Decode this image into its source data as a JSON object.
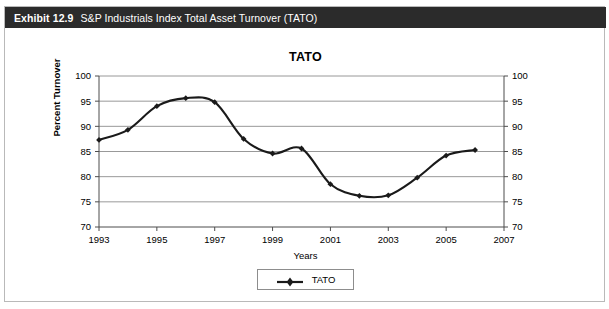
{
  "exhibit": {
    "number": "Exhibit 12.9",
    "caption": "S&P Industrials Index Total Asset Turnover (TATO)"
  },
  "legend": {
    "series_label": "TATO"
  },
  "colors": {
    "header_background": "#2b2b2b",
    "header_text": "#ffffff",
    "series_line": "#1a1a1a",
    "gridline": "#8d8d8d",
    "axis": "#4d4d4d",
    "card_border": "#b9b9b9"
  },
  "chart_data": {
    "type": "line",
    "title": "TATO",
    "xlabel": "Years",
    "ylabel": "Percent Turnover",
    "x": [
      1993,
      1994,
      1995,
      1996,
      1997,
      1998,
      1999,
      2000,
      2001,
      2002,
      2003,
      2004,
      2005,
      2006
    ],
    "series": [
      {
        "name": "TATO",
        "values": [
          87.3,
          89.3,
          94.0,
          95.6,
          94.8,
          87.5,
          84.6,
          85.6,
          78.5,
          76.2,
          76.3,
          79.8,
          84.2,
          85.3
        ]
      }
    ],
    "xlim": [
      1993,
      2007
    ],
    "ylim": [
      70,
      100
    ],
    "xticks": [
      1993,
      1995,
      1997,
      1999,
      2001,
      2003,
      2005,
      2007
    ],
    "xticklabels": [
      "1993",
      "1995",
      "1997",
      "1999",
      "2001",
      "2003",
      "2005",
      "2007"
    ],
    "yticks": [
      70,
      75,
      80,
      85,
      90,
      95,
      100
    ],
    "yticklabels": [
      "70",
      "75",
      "80",
      "85",
      "90",
      "95",
      "100"
    ],
    "yticklabels_right": [
      "70",
      "75",
      "80",
      "85",
      "90",
      "95",
      "100"
    ],
    "grid": true,
    "grid_axis": "y",
    "legend_position": "bottom-center",
    "marker": "diamond",
    "dual_y_axis": true
  }
}
